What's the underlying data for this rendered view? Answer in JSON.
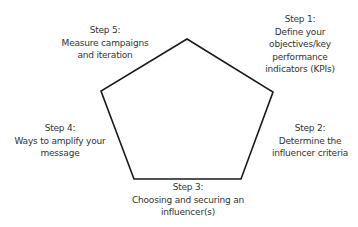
{
  "diagram": {
    "shape": "pentagon",
    "stroke_color": "#1a1a1a",
    "text_color": "#333333",
    "background": "#ffffff",
    "vertices": [
      [
        187,
        39
      ],
      [
        273,
        92
      ],
      [
        241,
        179
      ],
      [
        134,
        179
      ],
      [
        101,
        91
      ]
    ],
    "steps": [
      {
        "title": "Step 1:",
        "lines": [
          "Define your",
          "objectives/key",
          "performance",
          "indicators (KPIs)"
        ]
      },
      {
        "title": "Step 2:",
        "lines": [
          "Determine the",
          "influencer criteria"
        ]
      },
      {
        "title": "Step 3:",
        "lines": [
          "Choosing and securing an",
          "influencer(s)"
        ]
      },
      {
        "title": "Step 4:",
        "lines": [
          "Ways to amplify your",
          "message"
        ]
      },
      {
        "title": "Step 5:",
        "lines": [
          "Measure campaigns",
          "and iteration"
        ]
      }
    ]
  }
}
